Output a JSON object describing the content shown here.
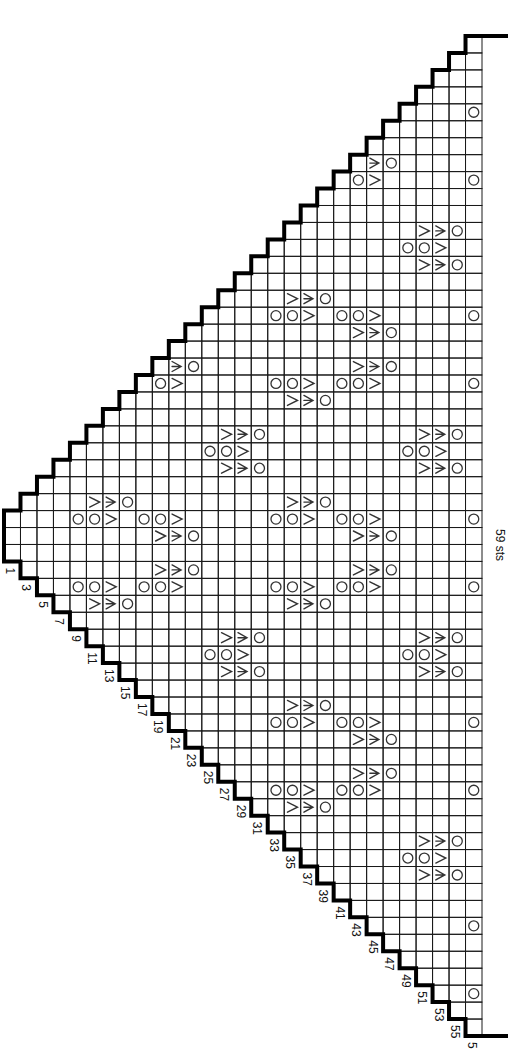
{
  "chart": {
    "orientation": "rotated-90-clockwise",
    "stitch_count_label": "59 sts",
    "columns": 29,
    "stitches": 59,
    "row_labels": [
      "1",
      "3",
      "5",
      "7",
      "9",
      "11",
      "13",
      "15",
      "17",
      "19",
      "21",
      "23",
      "25",
      "27",
      "29",
      "31",
      "33",
      "35",
      "37",
      "39",
      "41",
      "43",
      "45",
      "47",
      "49",
      "51",
      "53",
      "55",
      "5"
    ],
    "legend_symbols": {
      "yo": "circle (yarn over)",
      "dec_left": "lambda (decrease)",
      "dec_right": "mirrored lambda (decrease)",
      "double_dec": "three-prong (double decrease)"
    },
    "colors": {
      "ink": "#1a1a1a",
      "symbol": "#333333",
      "background": "#ffffff"
    }
  }
}
